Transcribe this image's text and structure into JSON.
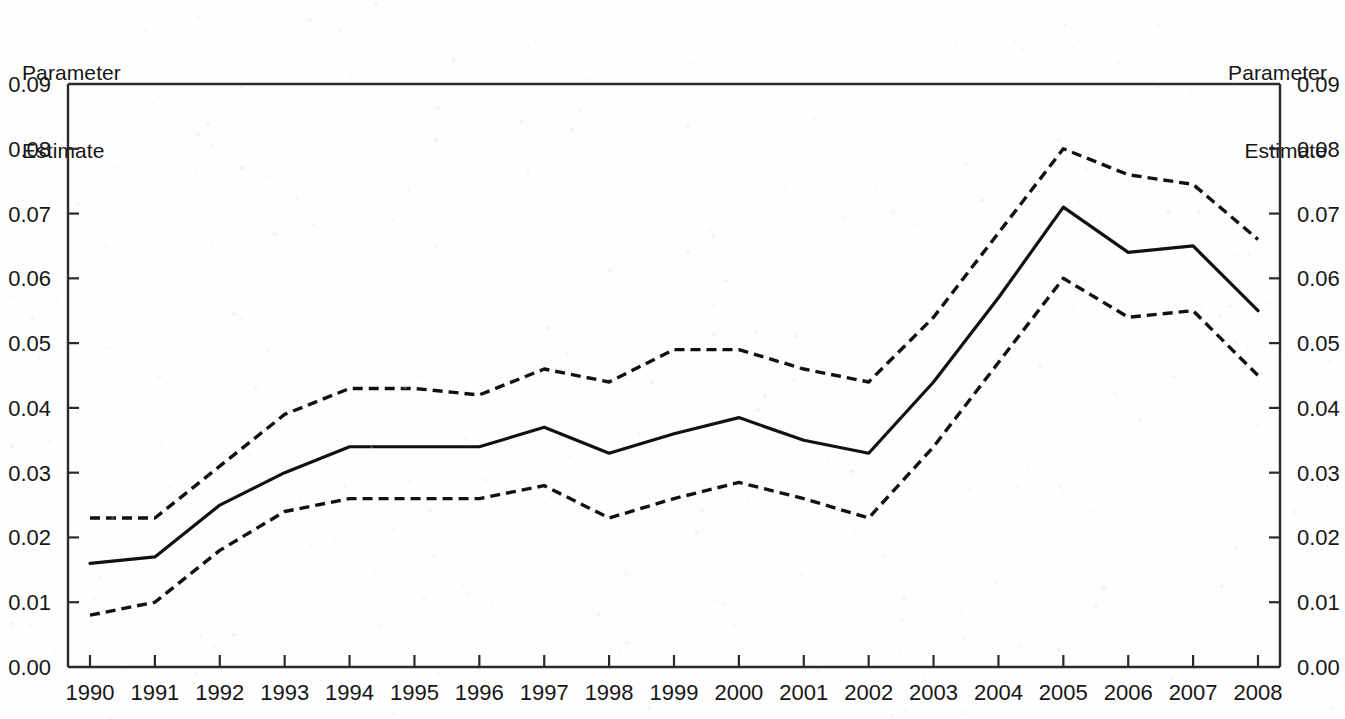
{
  "figure": {
    "background_color": "#fefefe",
    "ink_color": "#111111",
    "left_axis_title_line1": "Parameter",
    "left_axis_title_line2": "Estimate",
    "right_axis_title_line1": "Parameter",
    "right_axis_title_line2": "Estimate"
  },
  "chart_data": {
    "type": "line",
    "title": "",
    "subtitle": "",
    "xlabel": "",
    "ylabel": "Parameter Estimate",
    "y2label": "Parameter Estimate",
    "grid": false,
    "legend": "none",
    "xlim": [
      1990,
      2008
    ],
    "ylim": [
      0.0,
      0.09
    ],
    "ytick_values": [
      0.0,
      0.01,
      0.02,
      0.03,
      0.04,
      0.05,
      0.06,
      0.07,
      0.08,
      0.09
    ],
    "ytick_labels": [
      "0.00",
      "0.01",
      "0.02",
      "0.03",
      "0.04",
      "0.05",
      "0.06",
      "0.07",
      "0.08",
      "0.09"
    ],
    "categories": [
      1990,
      1991,
      1992,
      1993,
      1994,
      1995,
      1996,
      1997,
      1998,
      1999,
      2000,
      2001,
      2002,
      2003,
      2004,
      2005,
      2006,
      2007,
      2008
    ],
    "xtick_labels": [
      "1990",
      "1991",
      "1992",
      "1993",
      "1994",
      "1995",
      "1996",
      "1997",
      "1998",
      "1999",
      "2000",
      "2001",
      "2002",
      "2003",
      "2004",
      "2005",
      "2006",
      "2007",
      "2008"
    ],
    "series": [
      {
        "name": "Parameter estimate",
        "style": "solid",
        "values": [
          0.016,
          0.017,
          0.025,
          0.03,
          0.034,
          0.034,
          0.034,
          0.037,
          0.033,
          0.036,
          0.0385,
          0.035,
          0.033,
          0.044,
          0.057,
          0.071,
          0.064,
          0.065,
          0.055
        ]
      },
      {
        "name": "Upper confidence limit",
        "style": "dashed",
        "values": [
          0.023,
          0.023,
          0.031,
          0.039,
          0.043,
          0.043,
          0.042,
          0.046,
          0.044,
          0.049,
          0.049,
          0.046,
          0.044,
          0.054,
          0.067,
          0.08,
          0.076,
          0.0745,
          0.066
        ]
      },
      {
        "name": "Lower confidence limit",
        "style": "dashed",
        "values": [
          0.008,
          0.01,
          0.018,
          0.024,
          0.026,
          0.026,
          0.026,
          0.028,
          0.023,
          0.026,
          0.0285,
          0.026,
          0.023,
          0.034,
          0.047,
          0.06,
          0.054,
          0.055,
          0.045
        ]
      }
    ]
  }
}
